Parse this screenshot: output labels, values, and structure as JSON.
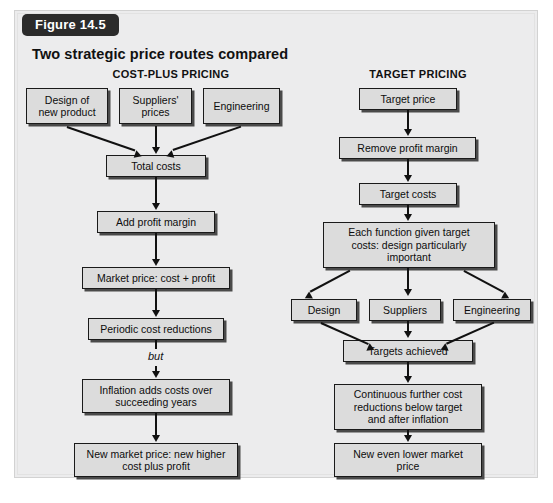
{
  "figure": {
    "badge": "Figure 14.5",
    "title": "Two strategic price routes compared"
  },
  "columns": {
    "left": {
      "heading": "COST-PLUS PRICING"
    },
    "right": {
      "heading": "TARGET PRICING"
    }
  },
  "left_flow": {
    "inputs": [
      {
        "label": "Design of\nnew product"
      },
      {
        "label": "Suppliers'\nprices"
      },
      {
        "label": "Engineering"
      }
    ],
    "steps": [
      {
        "label": "Total costs"
      },
      {
        "label": "Add profit margin"
      },
      {
        "label": "Market price: cost + profit"
      },
      {
        "label": "Periodic cost reductions"
      },
      {
        "label": "Inflation adds costs over\nsucceeding years"
      },
      {
        "label": "New market price: new higher\ncost plus profit"
      }
    ],
    "connector_note": "but"
  },
  "right_flow": {
    "steps_top": [
      {
        "label": "Target price"
      },
      {
        "label": "Remove profit margin"
      },
      {
        "label": "Target costs"
      },
      {
        "label": "Each function given target\ncosts: design particularly\nimportant"
      }
    ],
    "functions": [
      {
        "label": "Design"
      },
      {
        "label": "Suppliers"
      },
      {
        "label": "Engineering"
      }
    ],
    "steps_bottom": [
      {
        "label": "Targets achieved"
      },
      {
        "label": "Continuous further cost\nreductions below target\nand after inflation"
      },
      {
        "label": "New even lower market\nprice"
      }
    ]
  },
  "colors": {
    "panel_background": "#ececed",
    "box_fill": "#dcdcdc",
    "box_border": "#1a1a1a",
    "box_shadow": "#4a4a4a",
    "badge_background": "#2b2b2b",
    "badge_text": "#ffffff",
    "connector": "#111111"
  }
}
